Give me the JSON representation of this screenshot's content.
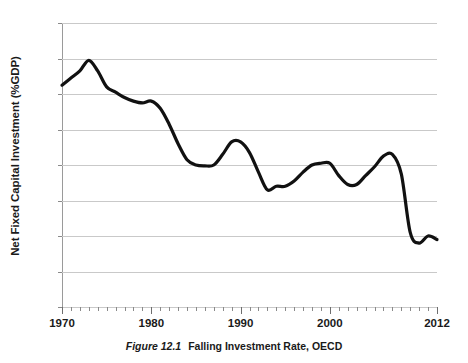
{
  "chart_data": {
    "type": "line",
    "title": "",
    "xlabel": "",
    "ylabel": "Net Fixed Capital Investment (%GDP)",
    "xlim": [
      1970,
      2012
    ],
    "ylim": [
      0,
      16
    ],
    "y_ticks": [
      0,
      2,
      4,
      6,
      8,
      10,
      12,
      14,
      16
    ],
    "y_tick_labels": [
      "0",
      "2",
      "4",
      "6",
      "8",
      "10",
      "12",
      "14",
      "16"
    ],
    "x_tick_labels": [
      "1970",
      "1980",
      "1990",
      "2000",
      "2012"
    ],
    "x_labeled_values": [
      1970,
      1980,
      1990,
      2000,
      2012
    ],
    "x_minor_tick_step": 1,
    "grid": "horizontal",
    "legend": "none",
    "line_color": "#111111",
    "grid_color": "#c9c9c9",
    "series": [
      {
        "name": "Net Fixed Capital Investment (%GDP)",
        "x": [
          1970,
          1971,
          1972,
          1973,
          1974,
          1975,
          1976,
          1977,
          1978,
          1979,
          1980,
          1981,
          1982,
          1983,
          1984,
          1985,
          1986,
          1987,
          1988,
          1989,
          1990,
          1991,
          1992,
          1993,
          1994,
          1995,
          1996,
          1997,
          1998,
          1999,
          2000,
          2001,
          2002,
          2003,
          2004,
          2005,
          2006,
          2007,
          2008,
          2009,
          2010,
          2011,
          2012
        ],
        "values": [
          12.5,
          12.9,
          13.3,
          13.9,
          13.3,
          12.4,
          12.1,
          11.8,
          11.6,
          11.5,
          11.6,
          11.2,
          10.3,
          9.2,
          8.3,
          8.0,
          7.95,
          8.0,
          8.6,
          9.3,
          9.3,
          8.7,
          7.6,
          6.6,
          6.8,
          6.8,
          7.1,
          7.6,
          8.0,
          8.1,
          8.1,
          7.4,
          6.9,
          6.9,
          7.4,
          7.9,
          8.5,
          8.6,
          7.5,
          4.2,
          3.6,
          4.0,
          3.8
        ]
      }
    ]
  },
  "caption": {
    "figure_number": "Figure 12.1",
    "text": "Falling Investment Rate, OECD"
  }
}
